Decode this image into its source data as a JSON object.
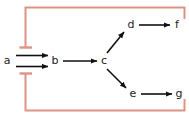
{
  "figure": {
    "width": 189,
    "height": 118,
    "background": "#ffffff"
  },
  "colors": {
    "activation_edge": "#111111",
    "inhibition_edge": "#dd9484",
    "node_label": "#1a1a1a"
  },
  "nodes": [
    {
      "id": "a",
      "label": "a",
      "x": 7,
      "y": 61
    },
    {
      "id": "b",
      "label": "b",
      "x": 55,
      "y": 61
    },
    {
      "id": "c",
      "label": "c",
      "x": 104,
      "y": 61
    },
    {
      "id": "d",
      "label": "d",
      "x": 131,
      "y": 25
    },
    {
      "id": "f",
      "label": "f",
      "x": 177,
      "y": 25
    },
    {
      "id": "e",
      "label": "e",
      "x": 133,
      "y": 94
    },
    {
      "id": "g",
      "label": "g",
      "x": 179,
      "y": 94
    }
  ],
  "edges": [
    {
      "id": "a-b-upper",
      "from": "a",
      "to": "b",
      "type": "activation",
      "arrowhead": "filled-triangle"
    },
    {
      "id": "a-b-lower",
      "from": "a",
      "to": "b",
      "type": "activation",
      "arrowhead": "filled-triangle"
    },
    {
      "id": "b-c",
      "from": "b",
      "to": "c",
      "type": "activation",
      "arrowhead": "filled-triangle"
    },
    {
      "id": "c-d",
      "from": "c",
      "to": "d",
      "type": "activation",
      "arrowhead": "filled-triangle"
    },
    {
      "id": "c-e",
      "from": "c",
      "to": "e",
      "type": "activation",
      "arrowhead": "filled-triangle"
    },
    {
      "id": "d-f",
      "from": "d",
      "to": "f",
      "type": "activation",
      "arrowhead": "filled-triangle"
    },
    {
      "id": "e-g",
      "from": "e",
      "to": "g",
      "type": "activation",
      "arrowhead": "filled-triangle"
    }
  ],
  "feedback_edges": [
    {
      "id": "f-to-ab-upper",
      "from": "f",
      "to": "a-b-upper",
      "type": "inhibition",
      "arrowhead": "bar",
      "route": "up-right, left across top, down to a-b link"
    },
    {
      "id": "g-to-ab-lower",
      "from": "g",
      "to": "a-b-lower",
      "type": "inhibition",
      "arrowhead": "bar",
      "route": "down-right, left across bottom, up to a-b link"
    }
  ]
}
